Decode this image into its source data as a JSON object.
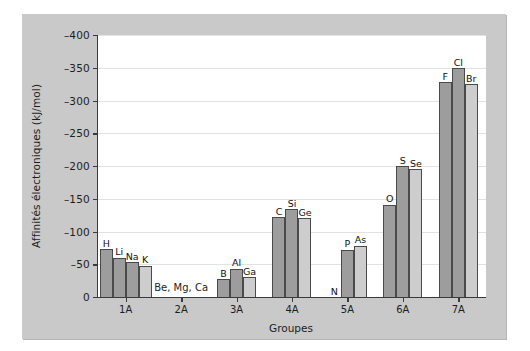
{
  "chart_data": {
    "type": "bar",
    "title": "",
    "xlabel": "Groupes",
    "ylabel": "Affinités électroniques (kJ/mol)",
    "ylim": [
      0,
      -400
    ],
    "ytick_labels": [
      "0",
      "-50",
      "-100",
      "-150",
      "-200",
      "-250",
      "-300",
      "-350",
      "-400"
    ],
    "ytick_values": [
      0,
      -50,
      -100,
      -150,
      -200,
      -250,
      -300,
      -350,
      -400
    ],
    "grid": true,
    "legend": "none",
    "categories": [
      "1A",
      "2A",
      "3A",
      "4A",
      "5A",
      "6A",
      "7A"
    ],
    "groups": [
      {
        "label": "1A",
        "note": "",
        "bars": [
          {
            "label": "H",
            "value": -73,
            "shade": "dark"
          },
          {
            "label": "Li",
            "value": -60,
            "shade": "dark"
          },
          {
            "label": "Na",
            "value": -53,
            "shade": "dark"
          },
          {
            "label": "K",
            "value": -48,
            "shade": "light"
          }
        ]
      },
      {
        "label": "2A",
        "note": "Be, Mg, Ca",
        "bars": []
      },
      {
        "label": "3A",
        "note": "",
        "bars": [
          {
            "label": "B",
            "value": -27,
            "shade": "dark"
          },
          {
            "label": "Al",
            "value": -43,
            "shade": "dark"
          },
          {
            "label": "Ga",
            "value": -30,
            "shade": "light"
          }
        ]
      },
      {
        "label": "4A",
        "note": "",
        "bars": [
          {
            "label": "C",
            "value": -122,
            "shade": "dark"
          },
          {
            "label": "Si",
            "value": -134,
            "shade": "dark"
          },
          {
            "label": "Ge",
            "value": -120,
            "shade": "light"
          }
        ]
      },
      {
        "label": "5A",
        "note": "",
        "bars": [
          {
            "label": "N",
            "value": 0,
            "shade": "dark"
          },
          {
            "label": "P",
            "value": -72,
            "shade": "dark"
          },
          {
            "label": "As",
            "value": -78,
            "shade": "light"
          }
        ]
      },
      {
        "label": "6A",
        "note": "",
        "bars": [
          {
            "label": "O",
            "value": -141,
            "shade": "dark"
          },
          {
            "label": "S",
            "value": -200,
            "shade": "dark"
          },
          {
            "label": "Se",
            "value": -195,
            "shade": "light"
          }
        ]
      },
      {
        "label": "7A",
        "note": "",
        "bars": [
          {
            "label": "F",
            "value": -328,
            "shade": "dark"
          },
          {
            "label": "Cl",
            "value": -349,
            "shade": "dark"
          },
          {
            "label": "Br",
            "value": -325,
            "shade": "light"
          }
        ]
      }
    ]
  },
  "colors": {
    "panel_background": "#c9c9c9",
    "plot_background": "#ffffff",
    "axis": "#3a3a3a",
    "gridline": "#e2e2e2",
    "bar_dark": "#9d9d9d",
    "bar_light": "#cdcdcd",
    "bar_outline": "#4a4a4a",
    "text": "#1d1d1d"
  }
}
